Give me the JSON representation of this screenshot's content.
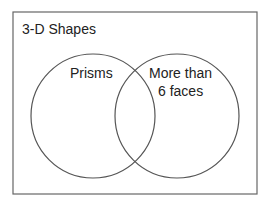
{
  "diagram": {
    "type": "venn",
    "universe_label": "3-D Shapes",
    "sets": [
      {
        "label_lines": [
          "Prisms"
        ]
      },
      {
        "label_lines": [
          "More than",
          "6 faces"
        ]
      }
    ],
    "colors": {
      "stroke": "#555555",
      "background": "#ffffff",
      "text": "#222222"
    }
  }
}
